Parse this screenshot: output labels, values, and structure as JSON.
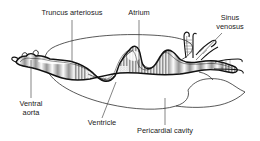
{
  "figure": {
    "background_color": "#ffffff",
    "ink_color": "#111111",
    "label_color": "#1a1a1a",
    "width": 260,
    "height": 141
  },
  "labels": {
    "truncus_arteriosus": "Truncus arteriosus",
    "atrium": "Atrium",
    "sinus_venosus_line1": "Sinus",
    "sinus_venosus_line2": "venosus",
    "ventral_aorta_line1": "Ventral",
    "ventral_aorta_line2": "aorta",
    "ventricle": "Ventricle",
    "pericardial_cavity": "Pericardial cavity"
  },
  "parts": [
    {
      "name": "truncus-arteriosus",
      "label": "Truncus arteriosus",
      "position": "top-left"
    },
    {
      "name": "atrium",
      "label": "Atrium",
      "position": "top-center"
    },
    {
      "name": "sinus-venosus",
      "label": "Sinus venosus",
      "position": "top-right"
    },
    {
      "name": "ventral-aorta",
      "label": "Ventral aorta",
      "position": "bottom-left"
    },
    {
      "name": "ventricle",
      "label": "Ventricle",
      "position": "bottom-center"
    },
    {
      "name": "pericardial-cavity",
      "label": "Pericardial cavity",
      "position": "bottom-right"
    }
  ]
}
